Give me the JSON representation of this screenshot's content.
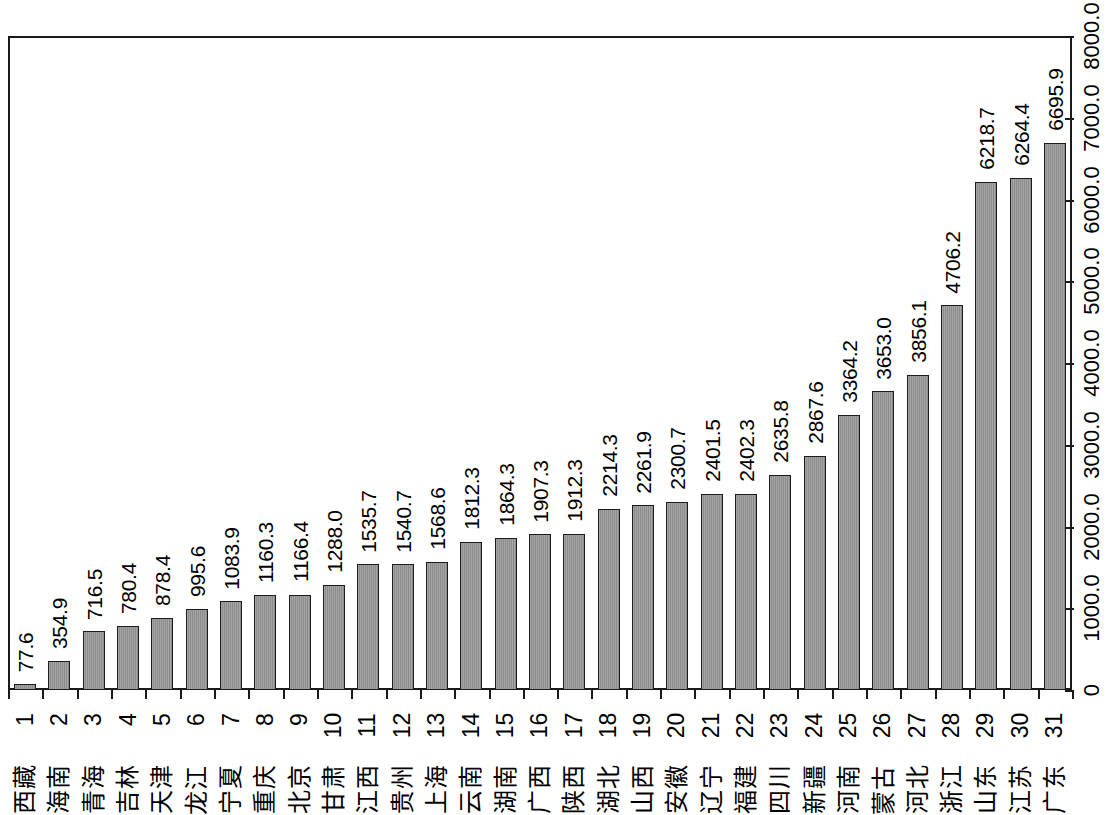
{
  "chart_data": {
    "type": "bar",
    "title": "",
    "xlabel": "",
    "ylabel": "",
    "ylim": [
      0,
      8000
    ],
    "grid": false,
    "legend": "none",
    "orientation": "vertical-rotated-labels",
    "y_ticks": [
      "0",
      "1000.0",
      "2000.0",
      "3000.0",
      "4000.0",
      "5000.0",
      "6000.0",
      "7000.0",
      "8000.0"
    ],
    "y_tick_values": [
      0,
      1000,
      2000,
      3000,
      4000,
      5000,
      6000,
      7000,
      8000
    ],
    "index_labels": [
      "1",
      "2",
      "3",
      "4",
      "5",
      "6",
      "7",
      "8",
      "9",
      "10",
      "11",
      "12",
      "13",
      "14",
      "15",
      "16",
      "17",
      "18",
      "19",
      "20",
      "21",
      "22",
      "23",
      "24",
      "25",
      "26",
      "27",
      "28",
      "29",
      "30",
      "31"
    ],
    "categories": [
      "西藏",
      "海南",
      "青海",
      "吉林",
      "天津",
      "黑龙江",
      "宁夏",
      "重庆",
      "北京",
      "甘肃",
      "江西",
      "贵州",
      "上海",
      "云南",
      "湖南",
      "广西",
      "陕西",
      "湖北",
      "山西",
      "安徽",
      "辽宁",
      "福建",
      "四川",
      "新疆",
      "河南",
      "内蒙古",
      "河北",
      "浙江",
      "山东",
      "江苏",
      "广东"
    ],
    "values": [
      77.6,
      354.9,
      716.5,
      780.4,
      878.4,
      995.6,
      1083.9,
      1160.3,
      1166.4,
      1288.0,
      1535.7,
      1540.7,
      1568.6,
      1812.3,
      1864.3,
      1907.3,
      1912.3,
      2214.3,
      2261.9,
      2300.7,
      2401.5,
      2402.3,
      2635.8,
      2867.6,
      3364.2,
      3653.0,
      3856.1,
      4706.2,
      6218.7,
      6264.4,
      6695.9
    ],
    "value_labels": [
      "77.6",
      "354.9",
      "716.5",
      "780.4",
      "878.4",
      "995.6",
      "1083.9",
      "1160.3",
      "1166.4",
      "1288.0",
      "1535.7",
      "1540.7",
      "1568.6",
      "1812.3",
      "1864.3",
      "1907.3",
      "1912.3",
      "2214.3",
      "2261.9",
      "2300.7",
      "2401.5",
      "2402.3",
      "2635.8",
      "2867.6",
      "3364.2",
      "3653.0",
      "3856.1",
      "4706.2",
      "6218.7",
      "6264.4",
      "6695.9"
    ],
    "colors": {
      "bar_fill": "#8c8c8c",
      "bar_border": "#1c1c1c",
      "axis": "#1a1a1a",
      "background": "#ffffff",
      "text": "#000000"
    }
  }
}
